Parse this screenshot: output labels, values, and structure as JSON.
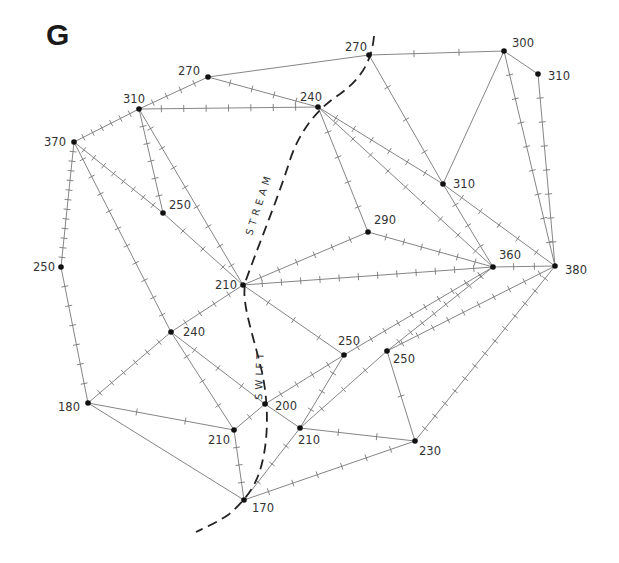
{
  "panel_letter": "G",
  "stream": {
    "label_upper": "STREAM",
    "label_lower": "SWIFT"
  },
  "nodes": [
    {
      "id": "n270a",
      "value": "270",
      "x": 208,
      "y": 77,
      "lx": -30,
      "ly": -2
    },
    {
      "id": "n310a",
      "value": "310",
      "x": 139,
      "y": 109,
      "lx": -16,
      "ly": -6
    },
    {
      "id": "n370",
      "value": "370",
      "x": 74,
      "y": 142,
      "lx": -30,
      "ly": 4
    },
    {
      "id": "n250a",
      "value": "250",
      "x": 61,
      "y": 267,
      "lx": -28,
      "ly": 4
    },
    {
      "id": "n250b",
      "value": "250",
      "x": 163,
      "y": 213,
      "lx": 6,
      "ly": -4
    },
    {
      "id": "n210a",
      "value": "210",
      "x": 243,
      "y": 285,
      "lx": -28,
      "ly": 4
    },
    {
      "id": "n240a",
      "value": "240",
      "x": 171,
      "y": 332,
      "lx": 12,
      "ly": 4
    },
    {
      "id": "n180",
      "value": "180",
      "x": 88,
      "y": 403,
      "lx": -30,
      "ly": 8
    },
    {
      "id": "n210b",
      "value": "210",
      "x": 234,
      "y": 430,
      "lx": -26,
      "ly": 14
    },
    {
      "id": "n200",
      "value": "200",
      "x": 265,
      "y": 404,
      "lx": 10,
      "ly": 6
    },
    {
      "id": "n210c",
      "value": "210",
      "x": 300,
      "y": 428,
      "lx": -2,
      "ly": 16
    },
    {
      "id": "n170",
      "value": "170",
      "x": 244,
      "y": 500,
      "lx": 8,
      "ly": 12
    },
    {
      "id": "n250c",
      "value": "250",
      "x": 344,
      "y": 355,
      "lx": -6,
      "ly": -10
    },
    {
      "id": "n250d",
      "value": "250",
      "x": 387,
      "y": 351,
      "lx": 6,
      "ly": 12
    },
    {
      "id": "n230",
      "value": "230",
      "x": 415,
      "y": 441,
      "lx": 4,
      "ly": 14
    },
    {
      "id": "n290",
      "value": "290",
      "x": 368,
      "y": 232,
      "lx": 6,
      "ly": -8
    },
    {
      "id": "n360",
      "value": "360",
      "x": 493,
      "y": 267,
      "lx": 6,
      "ly": -8
    },
    {
      "id": "n380",
      "value": "380",
      "x": 555,
      "y": 266,
      "lx": 10,
      "ly": 8
    },
    {
      "id": "n310b",
      "value": "310",
      "x": 443,
      "y": 184,
      "lx": 10,
      "ly": 4
    },
    {
      "id": "n240b",
      "value": "240",
      "x": 318,
      "y": 107,
      "lx": -18,
      "ly": -6
    },
    {
      "id": "n270b",
      "value": "270",
      "x": 369,
      "y": 55,
      "lx": -24,
      "ly": -4
    },
    {
      "id": "n300",
      "value": "300",
      "x": 504,
      "y": 51,
      "lx": 8,
      "ly": -4
    },
    {
      "id": "n310c",
      "value": "310",
      "x": 538,
      "y": 74,
      "lx": 10,
      "ly": 6
    }
  ],
  "edges": [
    {
      "a": "n370",
      "b": "n310a",
      "ticks": 6
    },
    {
      "a": "n310a",
      "b": "n270a",
      "ticks": 4
    },
    {
      "a": "n270a",
      "b": "n240b",
      "ticks": 4
    },
    {
      "a": "n270a",
      "b": "n270b",
      "ticks": 0
    },
    {
      "a": "n310a",
      "b": "n240b",
      "ticks": 7
    },
    {
      "a": "n270b",
      "b": "n300",
      "ticks": 2
    },
    {
      "a": "n300",
      "b": "n310c",
      "ticks": 0
    },
    {
      "a": "n300",
      "b": "n310b",
      "ticks": 0
    },
    {
      "a": "n300",
      "b": "n380",
      "ticks": 8
    },
    {
      "a": "n310c",
      "b": "n380",
      "ticks": 7
    },
    {
      "a": "n270b",
      "b": "n310b",
      "ticks": 3
    },
    {
      "a": "n310b",
      "b": "n360",
      "ticks": 3
    },
    {
      "a": "n240b",
      "b": "n310b",
      "ticks": 6
    },
    {
      "a": "n310b",
      "b": "n380",
      "ticks": 5
    },
    {
      "a": "n240b",
      "b": "n360",
      "ticks": 9
    },
    {
      "a": "n240b",
      "b": "n290",
      "ticks": 4
    },
    {
      "a": "n290",
      "b": "n360",
      "ticks": 6
    },
    {
      "a": "n290",
      "b": "n210a",
      "ticks": 6
    },
    {
      "a": "n210a",
      "b": "n360",
      "ticks": 12
    },
    {
      "a": "n360",
      "b": "n380",
      "ticks": 2
    },
    {
      "a": "n370",
      "b": "n250a",
      "ticks": 12
    },
    {
      "a": "n250a",
      "b": "n180",
      "ticks": 6
    },
    {
      "a": "n370",
      "b": "n240a",
      "ticks": 10
    },
    {
      "a": "n370",
      "b": "n250b",
      "ticks": 8
    },
    {
      "a": "n250b",
      "b": "n210a",
      "ticks": 3
    },
    {
      "a": "n310a",
      "b": "n250b",
      "ticks": 5
    },
    {
      "a": "n310a",
      "b": "n210a",
      "ticks": 8
    },
    {
      "a": "n210a",
      "b": "n240a",
      "ticks": 4
    },
    {
      "a": "n210a",
      "b": "n250c",
      "ticks": 3
    },
    {
      "a": "n240a",
      "b": "n180",
      "ticks": 6
    },
    {
      "a": "n240a",
      "b": "n210b",
      "ticks": 3
    },
    {
      "a": "n240a",
      "b": "n200",
      "ticks": 3
    },
    {
      "a": "n180",
      "b": "n210b",
      "ticks": 2
    },
    {
      "a": "n180",
      "b": "n170",
      "ticks": 0
    },
    {
      "a": "n210b",
      "b": "n200",
      "ticks": 1
    },
    {
      "a": "n210b",
      "b": "n170",
      "ticks": 3
    },
    {
      "a": "n200",
      "b": "n250c",
      "ticks": 4
    },
    {
      "a": "n200",
      "b": "n210c",
      "ticks": 0
    },
    {
      "a": "n250c",
      "b": "n210c",
      "ticks": 3
    },
    {
      "a": "n250c",
      "b": "n360",
      "ticks": 10
    },
    {
      "a": "n210c",
      "b": "n250d",
      "ticks": 3
    },
    {
      "a": "n210c",
      "b": "n230",
      "ticks": 2
    },
    {
      "a": "n170",
      "b": "n210c",
      "ticks": 3
    },
    {
      "a": "n170",
      "b": "n230",
      "ticks": 6
    },
    {
      "a": "n250d",
      "b": "n360",
      "ticks": 8
    },
    {
      "a": "n250d",
      "b": "n380",
      "ticks": 10
    },
    {
      "a": "n250d",
      "b": "n230",
      "ticks": 1
    },
    {
      "a": "n230",
      "b": "n380",
      "ticks": 13
    }
  ]
}
